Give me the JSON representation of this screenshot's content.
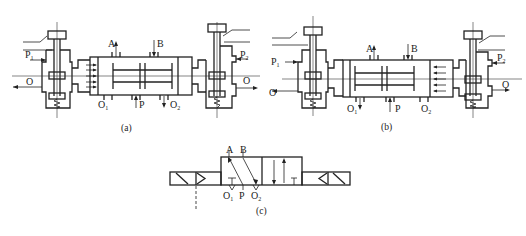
{
  "figure": {
    "panels": [
      {
        "id": "a",
        "caption": "(a)",
        "labels": {
          "A": "A",
          "B": "B",
          "P": "P",
          "O1_main": "O",
          "O1_sub": "1",
          "O2_main": "O",
          "O2_sub": "2",
          "P1_main": "P",
          "P1_sub": "1",
          "P2_main": "P",
          "P2_sub": "2",
          "O_left": "O",
          "O_right": "O"
        },
        "active_pilot": "left"
      },
      {
        "id": "b",
        "caption": "(b)",
        "labels": {
          "A": "A",
          "B": "B",
          "P": "P",
          "O1_main": "O",
          "O1_sub": "1",
          "O2_main": "O",
          "O2_sub": "2",
          "P1_main": "P",
          "P1_sub": "1",
          "P2_main": "P",
          "P2_sub": "2",
          "O_left": "O",
          "O_right": "O"
        },
        "active_pilot": "right"
      },
      {
        "id": "c",
        "caption": "(c)",
        "labels": {
          "A": "A",
          "B": "B",
          "P": "P",
          "O1_main": "O",
          "O1_sub": "1",
          "O2_main": "O",
          "O2_sub": "2"
        }
      }
    ],
    "colors": {
      "line": "#222222",
      "background": "#ffffff"
    }
  }
}
